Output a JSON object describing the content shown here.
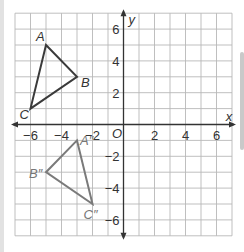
{
  "axes": {
    "x_label": "x",
    "y_label": "y",
    "origin_label": "O",
    "x_range": [
      -7,
      7
    ],
    "y_range": [
      -7,
      7
    ],
    "x_ticks": [
      {
        "value": -6,
        "label": "−6"
      },
      {
        "value": -4,
        "label": "−4"
      },
      {
        "value": -2,
        "label": "−2"
      },
      {
        "value": 2,
        "label": "2"
      },
      {
        "value": 4,
        "label": "4"
      },
      {
        "value": 6,
        "label": "6"
      }
    ],
    "y_ticks": [
      {
        "value": 6,
        "label": "6"
      },
      {
        "value": 4,
        "label": "4"
      },
      {
        "value": 2,
        "label": "2"
      },
      {
        "value": -2,
        "label": "−2"
      },
      {
        "value": -4,
        "label": "−4"
      },
      {
        "value": -6,
        "label": "−6"
      }
    ],
    "grid": true,
    "grid_step": 1
  },
  "triangles": [
    {
      "name": "ABC",
      "color": "#3a3a3a",
      "vertices": [
        {
          "label": "A",
          "x": -5,
          "y": 5
        },
        {
          "label": "B",
          "x": -3,
          "y": 3
        },
        {
          "label": "C",
          "x": -6,
          "y": 1
        }
      ]
    },
    {
      "name": "A''B''C''",
      "color": "#7a7a7a",
      "vertices": [
        {
          "label": "A″",
          "x": -3,
          "y": -1
        },
        {
          "label": "B″",
          "x": -5,
          "y": -3
        },
        {
          "label": "C″",
          "x": -2,
          "y": -5
        }
      ]
    }
  ],
  "colors": {
    "grid": "#b8b8b8",
    "axis": "#333333",
    "triangle_original": "#3a3a3a",
    "triangle_image": "#7a7a7a"
  }
}
